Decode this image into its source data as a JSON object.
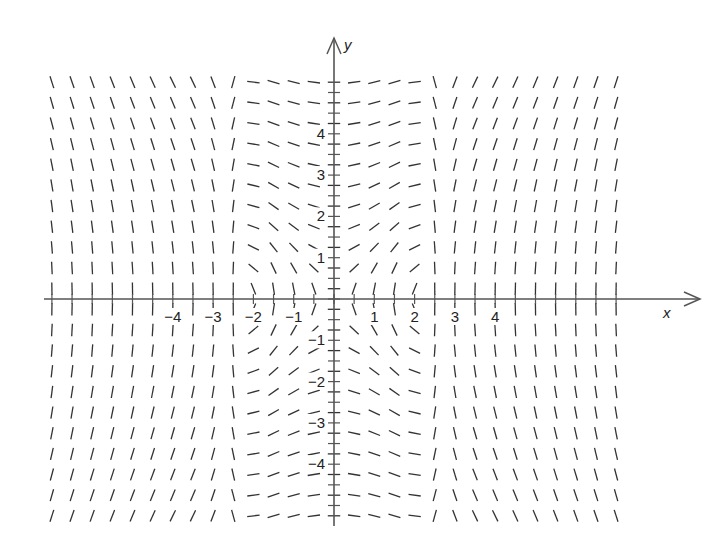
{
  "chart_data": {
    "type": "slope_field",
    "title": "",
    "xlabel": "x",
    "ylabel": "y",
    "x_ticks": [
      -4,
      -3,
      -2,
      -1,
      1,
      2,
      3,
      4
    ],
    "x_tick_labels": [
      "−4",
      "−3",
      "−2",
      "−1",
      "1",
      "2",
      "3",
      "4"
    ],
    "y_ticks": [
      -4,
      -3,
      -2,
      -1,
      1,
      2,
      3,
      4
    ],
    "y_tick_labels": [
      "−4",
      "−3",
      "−2",
      "−1",
      "1",
      "2",
      "3",
      "4"
    ],
    "xlim": [
      -7,
      7
    ],
    "ylim": [
      -5.4,
      5.4
    ],
    "grid": false,
    "legend": null,
    "field": {
      "grid_spacing_x": 0.5,
      "grid_spacing_y": 0.5,
      "x_range": [
        -7,
        7
      ],
      "y_range": [
        -5.25,
        5.25
      ],
      "description": "Slope segments: horizontal-ish near x=0 for large |y|, steepening toward the x-axis; sign flips across x=0 and across y=0; slopes pass through horizontal near x=±2.1 and become vertical near x=±2.6; nearly vertical for |x|>3.",
      "zero_slope_x": [
        -2.1,
        0,
        2.1
      ],
      "vertical_slope_x": [
        -2.6,
        2.6
      ]
    },
    "colors": {
      "ink": "#333333",
      "background": "#ffffff"
    }
  },
  "axes": {
    "x_axis_label": "x",
    "y_axis_label": "y"
  }
}
